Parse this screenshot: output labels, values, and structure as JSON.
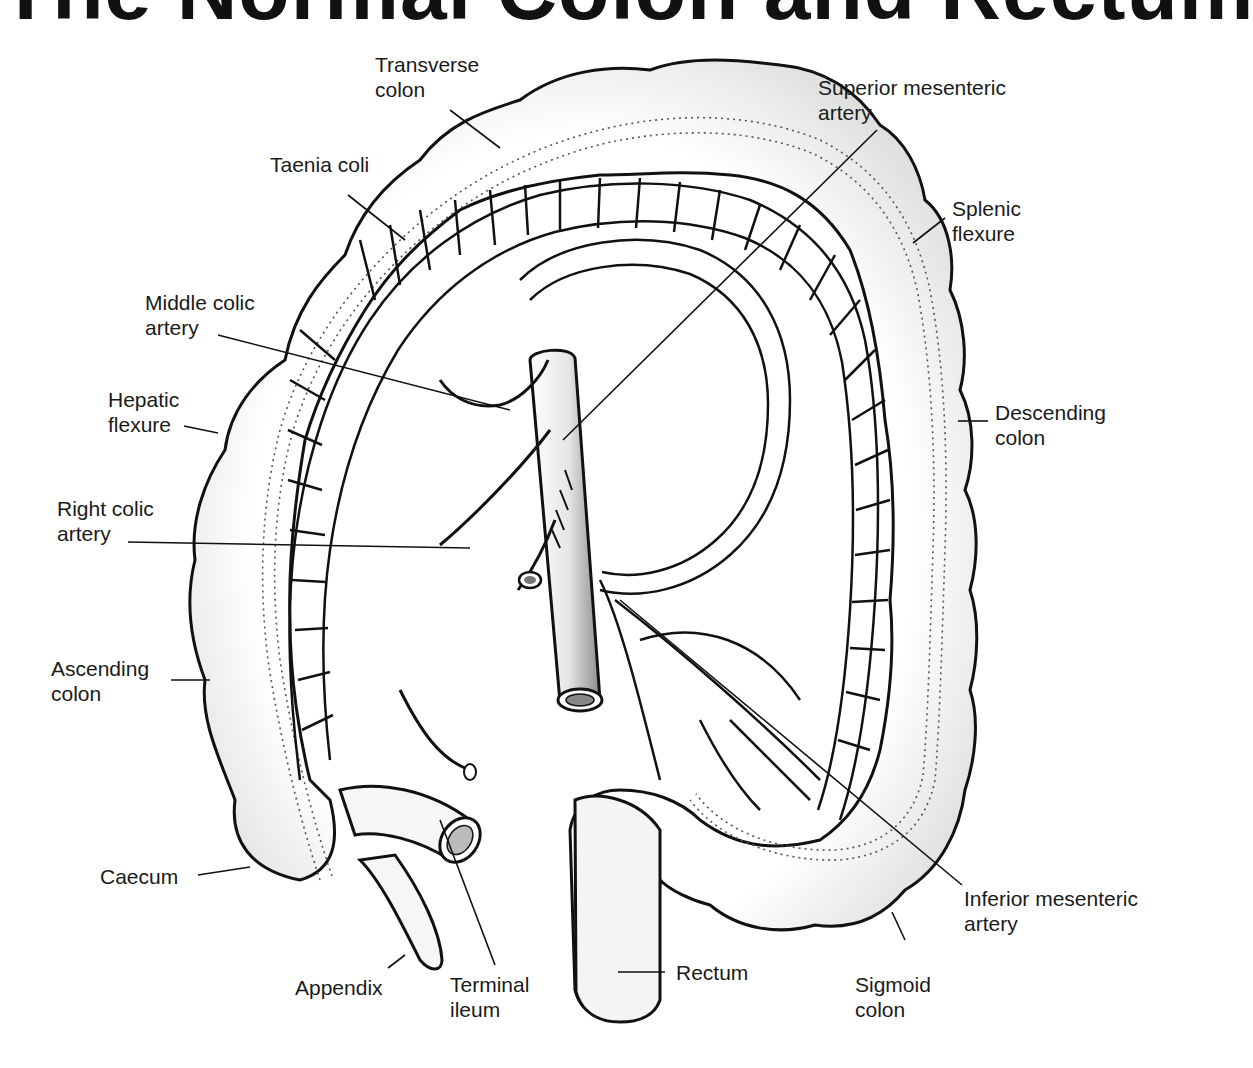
{
  "title": "The Normal Colon and Rectum",
  "labels": {
    "transverse_colon": "Transverse\ncolon",
    "superior_mesenteric_artery": "Superior mesenteric\nartery",
    "taenia_coli": "Taenia coli",
    "splenic_flexure": "Splenic\nflexure",
    "middle_colic_artery": "Middle colic\nartery",
    "hepatic_flexure": "Hepatic\nflexure",
    "descending_colon": "Descending\ncolon",
    "right_colic_artery": "Right colic\nartery",
    "ascending_colon": "Ascending\ncolon",
    "caecum": "Caecum",
    "appendix": "Appendix",
    "terminal_ileum": "Terminal\nileum",
    "rectum": "Rectum",
    "sigmoid_colon": "Sigmoid\ncolon",
    "inferior_mesenteric_artery": "Inferior mesenteric\nartery"
  }
}
